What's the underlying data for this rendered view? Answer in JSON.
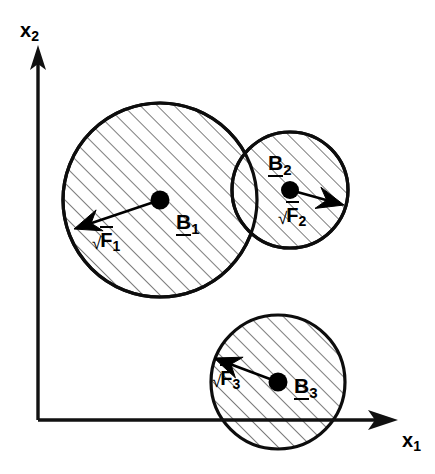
{
  "figure": {
    "background_color": "#ffffff",
    "ink_color": "#000000",
    "width": 435,
    "height": 474
  },
  "axes": {
    "horizontal": {
      "name": "x1-axis",
      "label_base": "x",
      "label_sub": "1",
      "origin": [
        38,
        420
      ],
      "tip": [
        396,
        420
      ]
    },
    "vertical": {
      "name": "x2-axis",
      "label_base": "x",
      "label_sub": "2",
      "origin": [
        38,
        420
      ],
      "tip": [
        38,
        47
      ]
    }
  },
  "bodies": [
    {
      "id": "B1",
      "label_base": "B",
      "label_sub": "1",
      "center": [
        160,
        200
      ],
      "radius": 97,
      "label_pos": [
        176,
        211
      ],
      "force": {
        "id": "F1",
        "radical": "√",
        "label_base": "F",
        "label_sub": "1",
        "label_pos": [
          92,
          232
        ],
        "from": [
          160,
          200
        ],
        "to": [
          74,
          229
        ]
      }
    },
    {
      "id": "B2",
      "label_base": "B",
      "label_sub": "2",
      "center": [
        290,
        190
      ],
      "radius": 58,
      "label_pos": [
        268,
        158
      ],
      "force": {
        "id": "F2",
        "radical": "√",
        "label_base": "F",
        "label_sub": "2",
        "label_pos": [
          278,
          217
        ],
        "from": [
          290,
          190
        ],
        "to": [
          344,
          205
        ]
      }
    },
    {
      "id": "B3",
      "label_base": "B",
      "label_sub": "3",
      "center": [
        278,
        382
      ],
      "radius": 67,
      "label_pos": [
        294,
        392
      ],
      "force": {
        "id": "F3",
        "radical": "√",
        "label_base": "F",
        "label_sub": "3",
        "label_pos": [
          212,
          392
        ],
        "from": [
          278,
          382
        ],
        "to": [
          214,
          358
        ]
      }
    }
  ],
  "hatching": {
    "angle_degrees": 45,
    "spacing_px": 12,
    "color": "#1b1b1b"
  }
}
